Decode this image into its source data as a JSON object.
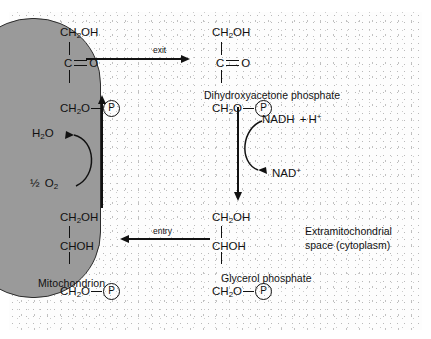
{
  "diagram": {
    "compartments": {
      "mitochondrion_label": "Mitochondrion",
      "cytoplasm_label_line1": "Extramitochondrial",
      "cytoplasm_label_line2": "space (cytoplasm)"
    },
    "molecules": {
      "dhap_inside": {
        "name": "Dihydroxyacetone phosphate (matrix side)",
        "line1": "CH",
        "line1_sub": "2",
        "line1_tail": "OH",
        "line2": "C",
        "line2_tail": "O",
        "line3": "CH",
        "line3_sub": "2",
        "line3_tail": "O",
        "phosphate": "P"
      },
      "dhap_outside": {
        "name": "Dihydroxyacetone phosphate",
        "line1": "CH",
        "line1_sub": "2",
        "line1_tail": "OH",
        "line2": "C",
        "line2_tail": "O",
        "line3": "CH",
        "line3_sub": "2",
        "line3_tail": "O",
        "phosphate": "P",
        "caption": "Dihydroxyacetone phosphate"
      },
      "glycerol_phosphate_inside": {
        "name": "Glycerol phosphate (matrix side)",
        "line1": "CH",
        "line1_sub": "2",
        "line1_tail": "OH",
        "line2": "CHOH",
        "line3": "CH",
        "line3_sub": "2",
        "line3_tail": "O",
        "phosphate": "P"
      },
      "glycerol_phosphate_outside": {
        "name": "Glycerol phosphate",
        "line1": "CH",
        "line1_sub": "2",
        "line1_tail": "OH",
        "line2": "CHOH",
        "line3": "CH",
        "line3_sub": "2",
        "line3_tail": "O",
        "phosphate": "P",
        "caption": "Glycerol phosphate"
      }
    },
    "arrows": {
      "exit_label": "exit",
      "entry_label": "entry"
    },
    "cofactors": {
      "nadh": "NADH",
      "nadh_plus": "+",
      "nadh_h": "H",
      "nadh_h_sup": "+",
      "nad": "NAD",
      "nad_sup": "+",
      "water": "H",
      "water_sub": "2",
      "water_tail": "O",
      "oxygen_half": "½",
      "oxygen": "O",
      "oxygen_sub": "2"
    },
    "colors": {
      "mitochondrion_fill": "#9a9a9a",
      "stroke": "#111111",
      "cytoplasm_bg": "#fdfdfd"
    }
  }
}
